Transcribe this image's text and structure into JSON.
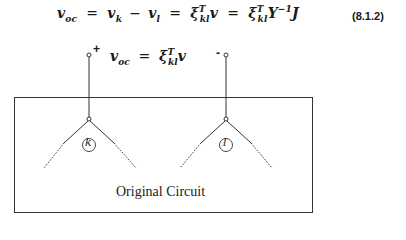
{
  "equation_main": {
    "lhs_var": "v",
    "lhs_sub": "oc",
    "eq1": "=",
    "term1_var": "v",
    "term1_sub": "k",
    "minus": "−",
    "term2_var": "v",
    "term2_sub": "l",
    "eq2": "=",
    "xi1": "ξ",
    "xi1_sup": "T",
    "xi1_sub": "kl",
    "xi1_rhs": "v",
    "eq3": "=",
    "xi2": "ξ",
    "xi2_sup": "T",
    "xi2_sub": "kl",
    "y_var": "Y",
    "y_sup": "−1",
    "j_var": "J",
    "number": "(8.1.2)"
  },
  "equation_voc": {
    "lhs_var": "v",
    "lhs_sub": "oc",
    "eq": "=",
    "xi": "ξ",
    "xi_sup": "T",
    "xi_sub": "kl",
    "rhs": "v"
  },
  "terminals": {
    "positive": "+",
    "negative": "-"
  },
  "nodes": [
    {
      "label": "k",
      "x": 89,
      "y": 119
    },
    {
      "label": "l",
      "x": 226,
      "y": 119
    }
  ],
  "box": {
    "caption": "Original Circuit"
  }
}
